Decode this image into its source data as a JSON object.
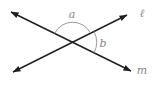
{
  "diagram": {
    "angle_a_label": "a",
    "angle_b_label": "b",
    "line_l_label": "ℓ",
    "line_m_label": "m"
  },
  "colors": {
    "line": "#1f1f1f",
    "arc": "#9a9a9a",
    "label": "#868686",
    "background": "#ffffff"
  }
}
